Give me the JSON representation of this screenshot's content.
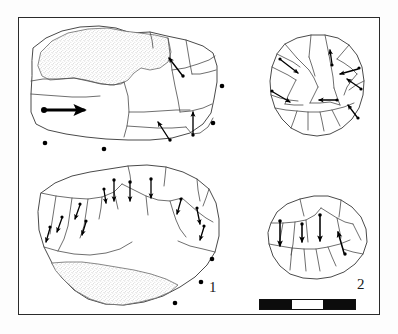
{
  "figure": {
    "type": "archaeological-lithic-plate",
    "background_color": "#ffffff",
    "frame_color": "#2b2b2b",
    "ink_color": "#3a3a3a",
    "arrow_color": "#000000",
    "cortex_fill": "stipple"
  },
  "labels": {
    "artifact_1": "1",
    "artifact_2": "2"
  },
  "scale_bar": {
    "segments": [
      {
        "tone": "dark",
        "width_pct": 33.3
      },
      {
        "tone": "light",
        "width_pct": 33.4
      },
      {
        "tone": "dark",
        "width_pct": 33.3
      }
    ],
    "border_color": "#111111"
  },
  "artifacts": [
    {
      "id": "artifact-1-profile",
      "label": "1",
      "view": "lateral-profile",
      "has_cortex": true,
      "cortex_position": "upper-left",
      "arrow_count": 4,
      "section_dot_count": 5
    },
    {
      "id": "artifact-1-dorsal",
      "label": "1",
      "view": "dorsal-face",
      "has_cortex": true,
      "cortex_position": "lower-band",
      "arrow_count": 9,
      "section_dot_count": 3
    },
    {
      "id": "artifact-2-discoidal",
      "label": "2",
      "view": "discoidal-core",
      "has_cortex": false,
      "arrow_count": 7,
      "section_dot_count": 0
    },
    {
      "id": "artifact-2-dorsal",
      "label": "2",
      "view": "dorsal-face",
      "has_cortex": false,
      "arrow_count": 4,
      "section_dot_count": 0
    }
  ]
}
